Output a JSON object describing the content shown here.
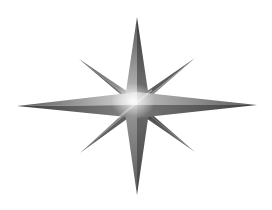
{
  "image": {
    "subject": "eight-pointed compass star",
    "width": 272,
    "height": 210,
    "background": "#ffffff"
  },
  "star": {
    "center": [
      137,
      105
    ],
    "main_points": {
      "north": [
        137,
        17
      ],
      "south": [
        137,
        195
      ],
      "west": [
        17,
        106
      ],
      "east": [
        257,
        105
      ],
      "base_half_width": 13
    },
    "diagonal_points": {
      "northwest": [
        79,
        59
      ],
      "northeast": [
        195,
        58
      ],
      "southwest": [
        80,
        153
      ],
      "southeast": [
        195,
        152
      ],
      "base_half_width": 8
    },
    "colors": {
      "dark": "#3a3a3a",
      "mid": "#6e6e6e",
      "light": "#a8a8a8",
      "highlight": "#f4f4f4"
    }
  }
}
